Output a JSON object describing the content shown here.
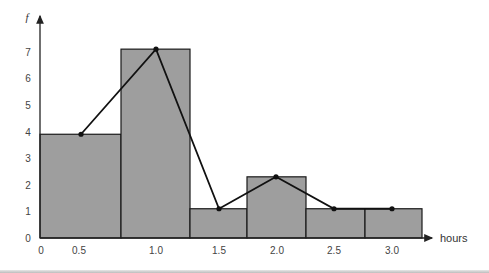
{
  "chart_data": {
    "type": "bar",
    "subtype": "histogram-with-frequency-polygon",
    "title": "",
    "xlabel": "hours",
    "ylabel": "f",
    "x_tick_labels": [
      "0",
      "0.5",
      "1.0",
      "1.5",
      "2.0",
      "2.5",
      "3.0"
    ],
    "y_tick_labels": [
      "0",
      "1",
      "2",
      "3",
      "4",
      "5",
      "6",
      "7"
    ],
    "categories": [
      "0.5",
      "1.0",
      "1.5",
      "2.0",
      "2.5",
      "3.0"
    ],
    "values": [
      3.9,
      7.1,
      1.1,
      2.3,
      1.1,
      1.1
    ],
    "ylim": [
      0,
      8
    ],
    "grid": false,
    "legend": null,
    "series": [
      {
        "name": "histogram",
        "type": "bar",
        "values": [
          3.9,
          7.1,
          1.1,
          2.3,
          1.1,
          1.1
        ]
      },
      {
        "name": "frequency polygon",
        "type": "line",
        "x": [
          0.5,
          1.0,
          1.5,
          2.0,
          2.5,
          3.0
        ],
        "values": [
          3.9,
          7.1,
          1.1,
          2.3,
          1.1,
          1.1
        ]
      }
    ],
    "colors": {
      "bar_fill": "#9e9e9e",
      "bar_edge": "#1a1a1a",
      "line": "#111111",
      "axis": "#222222"
    }
  }
}
